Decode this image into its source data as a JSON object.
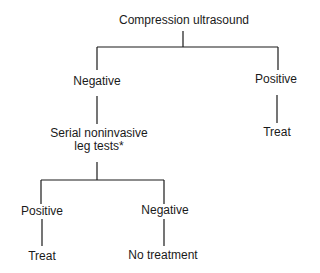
{
  "diagram": {
    "type": "decision-tree",
    "root": {
      "label": "Compression ultrasound"
    },
    "level1": {
      "negative": {
        "label": "Negative"
      },
      "positive": {
        "label": "Positive",
        "outcome": "Treat"
      }
    },
    "level2": {
      "serial_tests": {
        "line1": "Serial noninvasive",
        "line2": "leg tests*"
      },
      "positive": {
        "label": "Positive",
        "outcome": "Treat"
      },
      "negative": {
        "label": "Negative",
        "outcome": "No treatment"
      }
    },
    "line_color": "#1a1a1a",
    "text_color": "#1a1a1a"
  }
}
